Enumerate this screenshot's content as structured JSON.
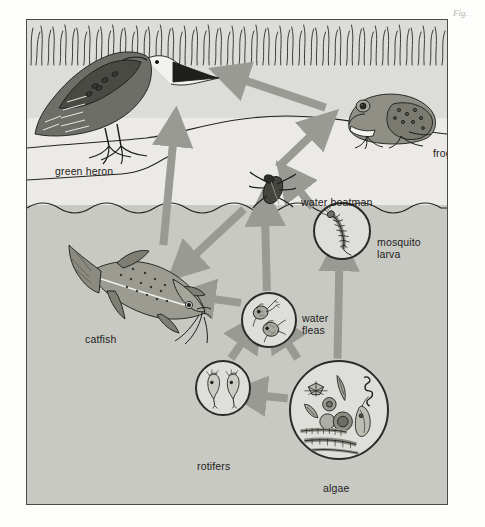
{
  "figure": {
    "type": "food-web",
    "background_colors": {
      "page": "#fdfdfc",
      "bank": "#dcdcd8",
      "air_above_water": "#eceae6",
      "water": "#c9c9c4",
      "frame_border": "#4a4a48",
      "arrow": "#9a9a95",
      "ink": "#1c1c1a"
    },
    "margin_note": "Fig."
  },
  "organisms": [
    {
      "id": "green-heron",
      "label": "green heron",
      "label_x": 28,
      "label_y": 145,
      "zone": "bank"
    },
    {
      "id": "frog",
      "label": "frog",
      "label_x": 406,
      "label_y": 127,
      "zone": "bank"
    },
    {
      "id": "water-boatman",
      "label": "water boatman",
      "label_x": 282,
      "label_y": 179,
      "zone": "surface"
    },
    {
      "id": "mosquito-larva",
      "label": "mosquito\nlarva",
      "label_x": 390,
      "label_y": 223,
      "zone": "water"
    },
    {
      "id": "catfish",
      "label": "catfish",
      "label_x": 58,
      "label_y": 313,
      "zone": "water"
    },
    {
      "id": "water-fleas",
      "label": "water\nfleas",
      "label_x": 303,
      "label_y": 306,
      "zone": "water"
    },
    {
      "id": "rotifers",
      "label": "rotifers",
      "label_x": 196,
      "label_y": 440,
      "zone": "water"
    },
    {
      "id": "algae",
      "label": "algae",
      "label_x": 325,
      "label_y": 474,
      "zone": "water"
    }
  ],
  "feeding_arrows": [
    {
      "from": "frog",
      "to": "green-heron"
    },
    {
      "from": "water-boatman",
      "to": "frog"
    },
    {
      "from": "catfish",
      "to": "green-heron"
    },
    {
      "from": "water-boatman",
      "to": "catfish"
    },
    {
      "from": "water-fleas",
      "to": "catfish"
    },
    {
      "from": "water-fleas",
      "to": "water-boatman"
    },
    {
      "from": "mosquito-larva",
      "to": "water-boatman"
    },
    {
      "from": "rotifers",
      "to": "water-fleas"
    },
    {
      "from": "algae",
      "to": "water-fleas"
    },
    {
      "from": "algae",
      "to": "rotifers"
    },
    {
      "from": "algae",
      "to": "mosquito-larva"
    }
  ]
}
